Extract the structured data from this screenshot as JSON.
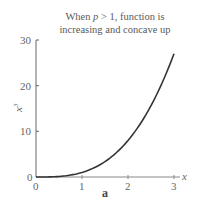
{
  "chart_data": {
    "type": "line",
    "title_lines": [
      "When p > 1, function is",
      "increasing and concave up"
    ],
    "xlabel": "x",
    "ylabel": "x^3",
    "xlim": [
      0,
      3.1
    ],
    "ylim": [
      0,
      30
    ],
    "xticks": [
      0,
      1,
      2,
      3
    ],
    "yticks": [
      0,
      10,
      20,
      30
    ],
    "grid": false,
    "legend": null,
    "subfigure_label": "a",
    "series": [
      {
        "name": "x^3",
        "function": "y = x^3",
        "x": [
          0,
          0.25,
          0.5,
          0.75,
          1,
          1.25,
          1.5,
          1.75,
          2,
          2.25,
          2.5,
          2.75,
          3
        ],
        "y": [
          0,
          0.016,
          0.125,
          0.422,
          1,
          1.953,
          3.375,
          5.359,
          8,
          11.391,
          15.625,
          20.797,
          27
        ],
        "color": "#333333"
      }
    ]
  },
  "labels": {
    "title_line1_pre": "When ",
    "title_var": "p",
    "title_line1_post": " > 1, function is",
    "title_line2": "increasing and concave up",
    "xlabel": "x",
    "ylabel_base": "x",
    "ylabel_exp": "3",
    "xtick_0": "0",
    "xtick_1": "1",
    "xtick_2": "2",
    "xtick_3": "3",
    "ytick_0": "0",
    "ytick_10": "10",
    "ytick_20": "20",
    "ytick_30": "30",
    "subfigure": "a"
  }
}
